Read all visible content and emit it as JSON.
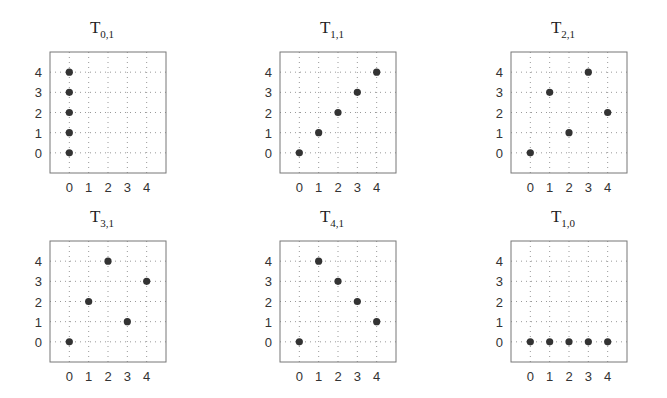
{
  "chart_data": [
    {
      "type": "scatter",
      "title": "T",
      "title_sub": "0,1",
      "x": [
        0,
        0,
        0,
        0,
        0
      ],
      "y": [
        0,
        1,
        2,
        3,
        4
      ],
      "xticks": [
        "0",
        "1",
        "2",
        "3",
        "4"
      ],
      "yticks": [
        "0",
        "1",
        "2",
        "3",
        "4"
      ],
      "xlim": [
        -1,
        5
      ],
      "ylim": [
        -1,
        5
      ],
      "grid": true,
      "xlabel": "",
      "ylabel": ""
    },
    {
      "type": "scatter",
      "title": "T",
      "title_sub": "1,1",
      "x": [
        0,
        1,
        2,
        3,
        4
      ],
      "y": [
        0,
        1,
        2,
        3,
        4
      ],
      "xticks": [
        "0",
        "1",
        "2",
        "3",
        "4"
      ],
      "yticks": [
        "0",
        "1",
        "2",
        "3",
        "4"
      ],
      "xlim": [
        -1,
        5
      ],
      "ylim": [
        -1,
        5
      ],
      "grid": true,
      "xlabel": "",
      "ylabel": ""
    },
    {
      "type": "scatter",
      "title": "T",
      "title_sub": "2,1",
      "x": [
        0,
        1,
        2,
        3,
        4
      ],
      "y": [
        0,
        3,
        1,
        4,
        2
      ],
      "xticks": [
        "0",
        "1",
        "2",
        "3",
        "4"
      ],
      "yticks": [
        "0",
        "1",
        "2",
        "3",
        "4"
      ],
      "xlim": [
        -1,
        5
      ],
      "ylim": [
        -1,
        5
      ],
      "grid": true,
      "xlabel": "",
      "ylabel": ""
    },
    {
      "type": "scatter",
      "title": "T",
      "title_sub": "3,1",
      "x": [
        0,
        1,
        2,
        3,
        4
      ],
      "y": [
        0,
        2,
        4,
        1,
        3
      ],
      "xticks": [
        "0",
        "1",
        "2",
        "3",
        "4"
      ],
      "yticks": [
        "0",
        "1",
        "2",
        "3",
        "4"
      ],
      "xlim": [
        -1,
        5
      ],
      "ylim": [
        -1,
        5
      ],
      "grid": true,
      "xlabel": "",
      "ylabel": ""
    },
    {
      "type": "scatter",
      "title": "T",
      "title_sub": "4,1",
      "x": [
        0,
        1,
        2,
        3,
        4
      ],
      "y": [
        0,
        4,
        3,
        2,
        1
      ],
      "xticks": [
        "0",
        "1",
        "2",
        "3",
        "4"
      ],
      "yticks": [
        "0",
        "1",
        "2",
        "3",
        "4"
      ],
      "xlim": [
        -1,
        5
      ],
      "ylim": [
        -1,
        5
      ],
      "grid": true,
      "xlabel": "",
      "ylabel": ""
    },
    {
      "type": "scatter",
      "title": "T",
      "title_sub": "1,0",
      "x": [
        0,
        1,
        2,
        3,
        4
      ],
      "y": [
        0,
        0,
        0,
        0,
        0
      ],
      "xticks": [
        "0",
        "1",
        "2",
        "3",
        "4"
      ],
      "yticks": [
        "0",
        "1",
        "2",
        "3",
        "4"
      ],
      "xlim": [
        -1,
        5
      ],
      "ylim": [
        -1,
        5
      ],
      "grid": true,
      "xlabel": "",
      "ylabel": ""
    }
  ],
  "colors": {
    "marker": "#333333",
    "frame": "#777777",
    "grid": "#999999"
  }
}
